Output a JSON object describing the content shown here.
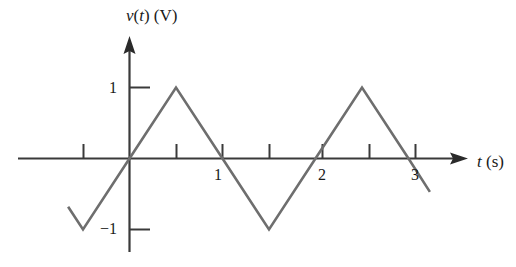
{
  "figure": {
    "kind": "line-plot",
    "background_color": "#ffffff",
    "axis_color": "#3a3a3a",
    "curve_color": "#6e6e6e",
    "text_color": "#1a1a1a"
  },
  "axes": {
    "y_title_plain_prefix": "v",
    "y_title": "v(t) (V)",
    "x_title": "t (s)",
    "y_ticks": [
      {
        "value": 1,
        "label": "1"
      },
      {
        "value": -1,
        "label": "−1"
      }
    ],
    "x_ticks": [
      {
        "value": -0.5,
        "label": ""
      },
      {
        "value": 0.5,
        "label": ""
      },
      {
        "value": 1,
        "label": "1"
      },
      {
        "value": 1.5,
        "label": ""
      },
      {
        "value": 2,
        "label": "2"
      },
      {
        "value": 2.5,
        "label": ""
      },
      {
        "value": 3,
        "label": "3"
      }
    ]
  },
  "chart_data": {
    "type": "line",
    "title": "",
    "subtitle": "",
    "xlabel": "t (s)",
    "ylabel": "v(t) (V)",
    "xlim": [
      -0.65,
      3.25
    ],
    "ylim": [
      -1.25,
      1.3
    ],
    "grid": false,
    "legend": "none",
    "waveform": "triangular",
    "period": 2,
    "amplitude": 1,
    "units": {
      "x": "s",
      "y": "V"
    },
    "series": [
      {
        "name": "v(t)",
        "color": "#6e6e6e",
        "x": [
          -0.66,
          -0.5,
          0,
          0.5,
          1,
          1.5,
          2,
          2.5,
          3,
          3.23
        ],
        "y": [
          -0.68,
          -1,
          0,
          1,
          0,
          -1,
          0,
          1,
          0,
          -0.47
        ]
      }
    ],
    "xticks": [
      -0.5,
      0.5,
      1,
      1.5,
      2,
      2.5,
      3
    ],
    "xticklabels": [
      "",
      "",
      "1",
      "",
      "2",
      "",
      "3"
    ],
    "yticks": [
      -1,
      1
    ],
    "yticklabels": [
      "−1",
      "1"
    ]
  }
}
